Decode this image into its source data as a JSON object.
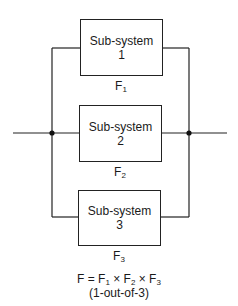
{
  "diagram": {
    "type": "parallel reliability block diagram",
    "subsystems": [
      {
        "title": "Sub-system",
        "number": "1",
        "failure_label": "F",
        "failure_sub": "1"
      },
      {
        "title": "Sub-system",
        "number": "2",
        "failure_label": "F",
        "failure_sub": "2"
      },
      {
        "title": "Sub-system",
        "number": "3",
        "failure_label": "F",
        "failure_sub": "3"
      }
    ],
    "formula": {
      "lhs": "F =",
      "terms": [
        {
          "base": "F",
          "sub": "1"
        },
        {
          "base": "F",
          "sub": "2"
        },
        {
          "base": "F",
          "sub": "3"
        }
      ],
      "operator": "×",
      "caption": "(1-out-of-3)"
    },
    "colors": {
      "line": "#222222",
      "background": "#ffffff"
    }
  }
}
